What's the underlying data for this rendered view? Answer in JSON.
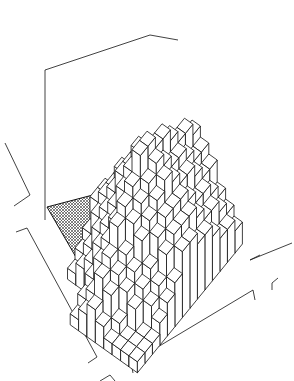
{
  "figure": {
    "colors": {
      "background": "#ffffff",
      "ink": "#1a1a1a",
      "hatch": "#333333"
    },
    "grid": {
      "rows": 14,
      "cols": 11
    }
  }
}
